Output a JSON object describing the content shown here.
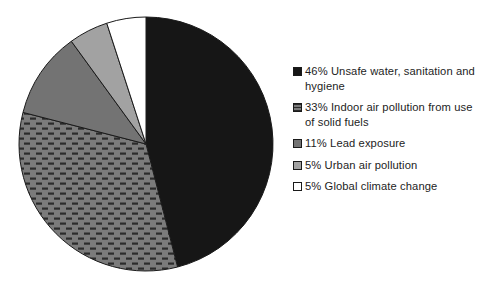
{
  "chart_data": {
    "type": "pie",
    "title": "",
    "subtitle": "",
    "xlabel": "",
    "ylabel": "",
    "grid": false,
    "legend_position": "right",
    "start_angle_deg": 0,
    "direction": "clockwise",
    "categories": [
      "Unsafe water, sanitation and hygiene",
      "Indoor air pollution from use of solid fuels",
      "Lead exposure",
      "Urban air pollution",
      "Global climate change"
    ],
    "values": [
      46,
      33,
      11,
      5,
      5
    ],
    "value_unit": "%",
    "slices": [
      {
        "label": "Unsafe water, sanitation and hygiene",
        "value": 46,
        "percent_text": "46%",
        "color": "#161616",
        "pattern": "solid",
        "start_deg": 0,
        "end_deg": 165.6
      },
      {
        "label": "Indoor air pollution from use of solid fuels",
        "value": 33,
        "percent_text": "33%",
        "color": "#7b7b7b",
        "pattern": "dashes",
        "start_deg": 165.6,
        "end_deg": 284.4
      },
      {
        "label": "Lead exposure",
        "value": 11,
        "percent_text": "11%",
        "color": "#737373",
        "pattern": "solid",
        "start_deg": 284.4,
        "end_deg": 324.0
      },
      {
        "label": "Urban air pollution",
        "value": 5,
        "percent_text": "5%",
        "color": "#a2a2a2",
        "pattern": "solid",
        "start_deg": 324.0,
        "end_deg": 342.0
      },
      {
        "label": "Global climate change",
        "value": 5,
        "percent_text": "5%",
        "color": "#ffffff",
        "pattern": "solid",
        "start_deg": 342.0,
        "end_deg": 360.0
      }
    ]
  },
  "legend": {
    "items": [
      {
        "text": "46% Unsafe water, sanitation and hygiene",
        "swatch_color": "#161616",
        "swatch_pattern": "solid"
      },
      {
        "text": "33% Indoor air pollution from use of solid fuels",
        "swatch_color": "#7b7b7b",
        "swatch_pattern": "dashes"
      },
      {
        "text": "11% Lead exposure",
        "swatch_color": "#737373",
        "swatch_pattern": "solid"
      },
      {
        "text": "5% Urban air pollution",
        "swatch_color": "#a2a2a2",
        "swatch_pattern": "solid"
      },
      {
        "text": "5% Global climate change",
        "swatch_color": "#ffffff",
        "swatch_pattern": "solid"
      }
    ]
  }
}
